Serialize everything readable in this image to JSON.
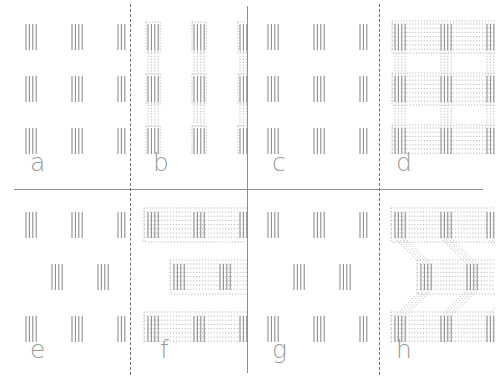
{
  "figure": {
    "type": "texture-stimulus-grid",
    "rows": 2,
    "columns": 4,
    "background_color": "#ffffff",
    "element_color": "#8a8a8a",
    "bridge_color": "#b4b4b4",
    "label_color": "#9a9a9a",
    "divider_color": "#8d8d8d"
  },
  "dividers": [
    {
      "name": "horizontal-main",
      "orientation": "horizontal",
      "style": "solid",
      "position_px": 189
    },
    {
      "name": "vertical-center",
      "orientation": "vertical",
      "style": "solid",
      "position_px": 247
    },
    {
      "name": "vertical-dashed-left",
      "orientation": "vertical",
      "style": "dashed",
      "position_px": 130
    },
    {
      "name": "vertical-dashed-right",
      "orientation": "vertical",
      "style": "dashed",
      "position_px": 379
    }
  ],
  "panels": [
    {
      "id": "a",
      "label": "a",
      "row": 1,
      "column": 1,
      "element_type": "triple-vertical-lines",
      "grid": "3x3",
      "row_offset": "middle-row-shifted-right",
      "bridges": "none",
      "element_rows": [
        {
          "offset_px": 0,
          "columns": [
            12,
            58,
            104
          ]
        },
        {
          "offset_px": 0,
          "columns": [
            12,
            58,
            104
          ]
        },
        {
          "offset_px": 0,
          "columns": [
            12,
            58,
            104
          ]
        }
      ],
      "stagger_px": 22,
      "line_count": 4,
      "line_height_px": 26
    },
    {
      "id": "b",
      "label": "b",
      "row": 1,
      "column": 2,
      "element_type": "triple-vertical-lines",
      "grid": "3x3",
      "row_offset": "middle-row-shifted-right",
      "bridges": "vertical-dotted",
      "element_rows": [
        {
          "offset_px": 0,
          "columns": [
            12,
            58,
            104
          ]
        },
        {
          "offset_px": 0,
          "columns": [
            12,
            58,
            104
          ]
        },
        {
          "offset_px": 0,
          "columns": [
            12,
            58,
            104
          ]
        }
      ],
      "stagger_px": 22,
      "line_count": 4,
      "line_height_px": 26
    },
    {
      "id": "c",
      "label": "c",
      "row": 1,
      "column": 3,
      "element_type": "triple-vertical-lines",
      "grid": "3x3",
      "row_offset": "aligned",
      "bridges": "none",
      "element_rows": [
        {
          "offset_px": 0,
          "columns": [
            12,
            58,
            104
          ]
        },
        {
          "offset_px": 0,
          "columns": [
            12,
            58,
            104
          ]
        },
        {
          "offset_px": 0,
          "columns": [
            12,
            58,
            104
          ]
        }
      ],
      "stagger_px": 0,
      "line_count": 4,
      "line_height_px": 26
    },
    {
      "id": "d",
      "label": "d",
      "row": 1,
      "column": 4,
      "element_type": "triple-vertical-lines",
      "grid": "3x3",
      "row_offset": "aligned",
      "bridges": "full-lattice-dotted",
      "element_rows": [
        {
          "offset_px": 0,
          "columns": [
            12,
            58,
            104
          ]
        },
        {
          "offset_px": 0,
          "columns": [
            12,
            58,
            104
          ]
        },
        {
          "offset_px": 0,
          "columns": [
            12,
            58,
            104
          ]
        }
      ],
      "stagger_px": 0,
      "line_count": 4,
      "line_height_px": 26
    },
    {
      "id": "e",
      "label": "e",
      "row": 2,
      "column": 1,
      "element_type": "triple-vertical-lines",
      "grid": "3x3",
      "row_offset": "middle-row-shifted-right",
      "bridges": "none",
      "element_rows": [
        {
          "offset_px": 0,
          "columns": [
            12,
            58,
            104
          ]
        },
        {
          "offset_px": 26,
          "columns": [
            12,
            58,
            104
          ]
        },
        {
          "offset_px": 0,
          "columns": [
            12,
            58,
            104
          ]
        }
      ],
      "stagger_px": 26,
      "line_count": 4,
      "line_height_px": 26
    },
    {
      "id": "f",
      "label": "f",
      "row": 2,
      "column": 2,
      "element_type": "triple-vertical-lines",
      "grid": "3x3",
      "row_offset": "middle-row-shifted-right",
      "bridges": "horizontal-dotted-rows",
      "element_rows": [
        {
          "offset_px": 0,
          "columns": [
            12,
            58,
            104
          ]
        },
        {
          "offset_px": 26,
          "columns": [
            12,
            58,
            104
          ]
        },
        {
          "offset_px": 0,
          "columns": [
            12,
            58,
            104
          ]
        }
      ],
      "stagger_px": 26,
      "line_count": 4,
      "line_height_px": 26
    },
    {
      "id": "g",
      "label": "g",
      "row": 2,
      "column": 3,
      "element_type": "triple-vertical-lines",
      "grid": "3x3",
      "row_offset": "middle-row-shifted-right",
      "bridges": "none",
      "element_rows": [
        {
          "offset_px": 0,
          "columns": [
            12,
            58,
            104
          ]
        },
        {
          "offset_px": 26,
          "columns": [
            12,
            58,
            104
          ]
        },
        {
          "offset_px": 0,
          "columns": [
            12,
            58,
            104
          ]
        }
      ],
      "stagger_px": 26,
      "line_count": 4,
      "line_height_px": 26
    },
    {
      "id": "h",
      "label": "h",
      "row": 2,
      "column": 4,
      "element_type": "triple-vertical-lines",
      "grid": "3x3",
      "row_offset": "middle-row-shifted-right",
      "bridges": "staggered-lattice-dotted",
      "element_rows": [
        {
          "offset_px": 0,
          "columns": [
            12,
            58,
            104
          ]
        },
        {
          "offset_px": 26,
          "columns": [
            12,
            58,
            104
          ]
        },
        {
          "offset_px": 0,
          "columns": [
            12,
            58,
            104
          ]
        }
      ],
      "stagger_px": 26,
      "line_count": 4,
      "line_height_px": 26
    }
  ]
}
